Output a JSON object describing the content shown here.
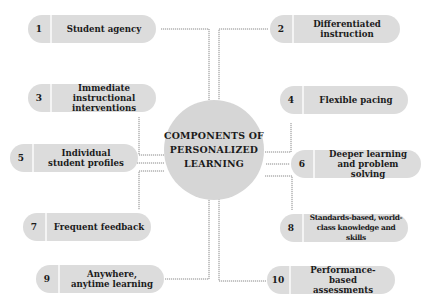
{
  "diagram": {
    "center": {
      "line1": "COMPONENTS OF",
      "line2": "PERSONALIZED",
      "line3": "LEARNING"
    },
    "components": [
      {
        "number": "1",
        "label": "Student agency"
      },
      {
        "number": "2",
        "label": "Differentiated instruction"
      },
      {
        "number": "3",
        "label": "Immediate instructional interventions"
      },
      {
        "number": "4",
        "label": "Flexible pacing"
      },
      {
        "number": "5",
        "label": "Individual student profiles"
      },
      {
        "number": "6",
        "label": "Deeper learning and problem solving"
      },
      {
        "number": "7",
        "label": "Frequent feedback"
      },
      {
        "number": "8",
        "label": "Standards-based, world-class knowledge and skills"
      },
      {
        "number": "9",
        "label": "Anywhere, anytime learning"
      },
      {
        "number": "10",
        "label": "Performance-based assessments"
      }
    ],
    "colors": {
      "pill": "#dcdcdc",
      "center": "#d6d6d6",
      "connector": "#8a8a8a",
      "text": "#1a1a1a"
    }
  }
}
